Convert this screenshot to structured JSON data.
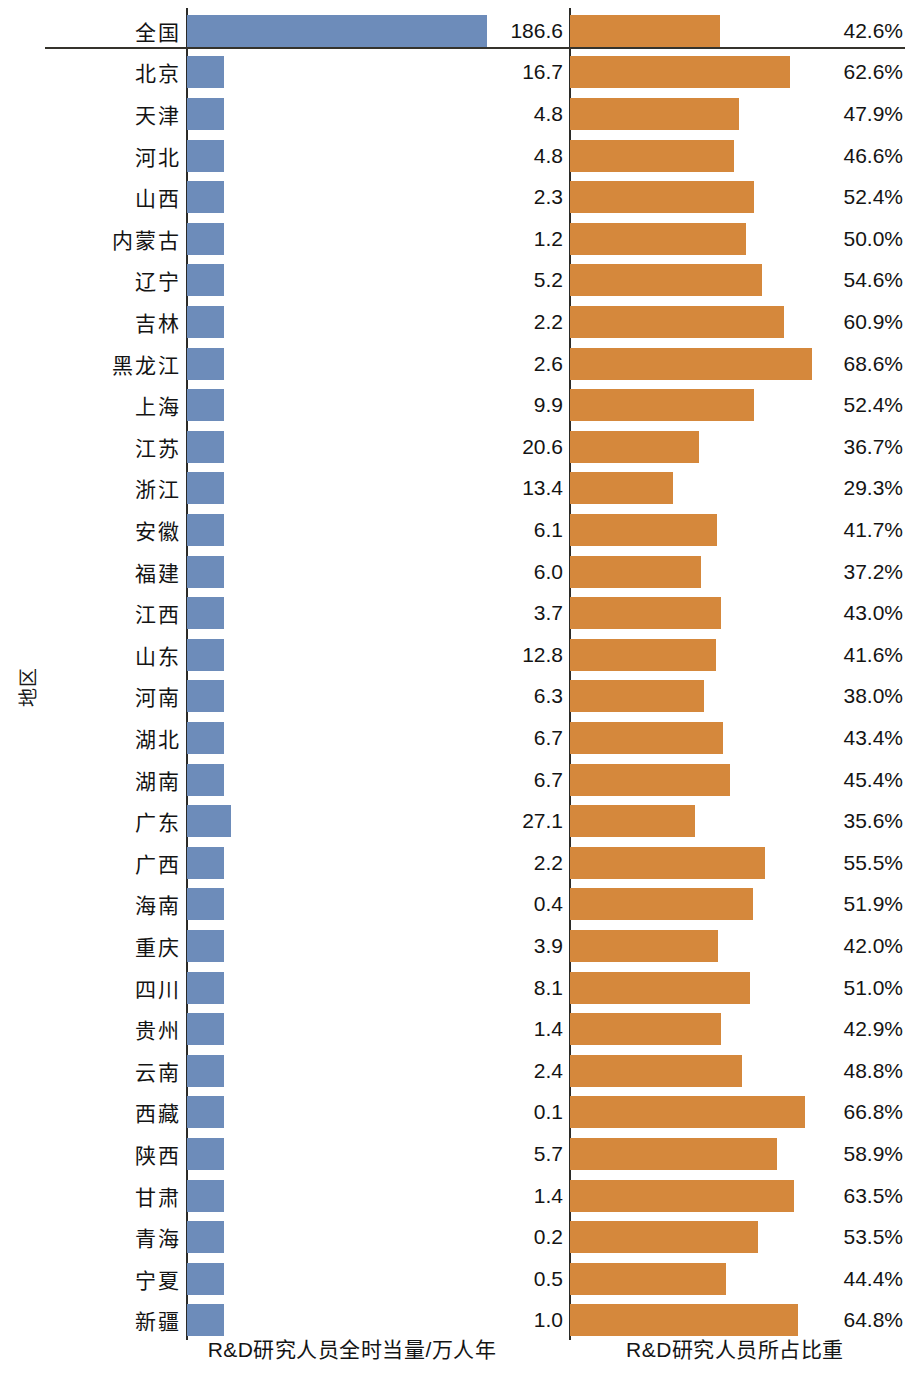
{
  "axis": {
    "y_title": "地区",
    "left_caption": "R&D研究人员全时当量/万人年",
    "right_caption": "R&D研究人员所占比重"
  },
  "colors": {
    "blue": "#6d8cba",
    "orange": "#d5883c",
    "axis": "#2b2b28",
    "text": "#141414"
  },
  "chart_data": {
    "type": "bar",
    "title": "",
    "subtitle": "",
    "orientation": "horizontal",
    "ylabel": "地区",
    "panels": [
      {
        "name": "left",
        "label": "R&D研究人员全时当量/万人年",
        "unit": "万人年",
        "axis_min": 0,
        "axis_max": 190
      },
      {
        "name": "right",
        "label": "R&D研究人员所占比重",
        "unit": "%",
        "axis_min": 0,
        "axis_max": 70
      }
    ],
    "grid": false,
    "legend": "none",
    "categories": [
      "全国",
      "北京",
      "天津",
      "河北",
      "山西",
      "内蒙古",
      "辽宁",
      "吉林",
      "黑龙江",
      "上海",
      "江苏",
      "浙江",
      "安徽",
      "福建",
      "江西",
      "山东",
      "河南",
      "湖北",
      "湖南",
      "广东",
      "广西",
      "海南",
      "重庆",
      "四川",
      "贵州",
      "云南",
      "西藏",
      "陕西",
      "甘肃",
      "青海",
      "宁夏",
      "新疆"
    ],
    "series": [
      {
        "name": "R&D研究人员全时当量/万人年",
        "color": "#6d8cba",
        "values": [
          186.6,
          16.7,
          4.8,
          4.8,
          2.3,
          1.2,
          5.2,
          2.2,
          2.6,
          9.9,
          20.6,
          13.4,
          6.1,
          6.0,
          3.7,
          12.8,
          6.3,
          6.7,
          6.7,
          27.1,
          2.2,
          0.4,
          3.9,
          8.1,
          1.4,
          2.4,
          0.1,
          5.7,
          1.4,
          0.2,
          0.5,
          1.0
        ]
      },
      {
        "name": "R&D研究人员所占比重",
        "color": "#d5883c",
        "values": [
          42.6,
          62.6,
          47.9,
          46.6,
          52.4,
          50.0,
          54.6,
          60.9,
          68.6,
          52.4,
          36.7,
          29.3,
          41.7,
          37.2,
          43.0,
          41.6,
          38.0,
          43.4,
          45.4,
          35.6,
          55.5,
          51.9,
          42.0,
          51.0,
          42.9,
          48.8,
          66.8,
          58.9,
          63.5,
          53.5,
          44.4,
          64.8
        ]
      }
    ]
  },
  "rows": [
    {
      "label": "全国",
      "value": "186.6",
      "v": 186.6,
      "pct": "42.6%",
      "p": 42.6,
      "is_total": true
    },
    {
      "label": "北京",
      "value": "16.7",
      "v": 16.7,
      "pct": "62.6%",
      "p": 62.6,
      "is_total": false
    },
    {
      "label": "天津",
      "value": "4.8",
      "v": 4.8,
      "pct": "47.9%",
      "p": 47.9,
      "is_total": false
    },
    {
      "label": "河北",
      "value": "4.8",
      "v": 4.8,
      "pct": "46.6%",
      "p": 46.6,
      "is_total": false
    },
    {
      "label": "山西",
      "value": "2.3",
      "v": 2.3,
      "pct": "52.4%",
      "p": 52.4,
      "is_total": false
    },
    {
      "label": "内蒙古",
      "value": "1.2",
      "v": 1.2,
      "pct": "50.0%",
      "p": 50.0,
      "is_total": false
    },
    {
      "label": "辽宁",
      "value": "5.2",
      "v": 5.2,
      "pct": "54.6%",
      "p": 54.6,
      "is_total": false
    },
    {
      "label": "吉林",
      "value": "2.2",
      "v": 2.2,
      "pct": "60.9%",
      "p": 60.9,
      "is_total": false
    },
    {
      "label": "黑龙江",
      "value": "2.6",
      "v": 2.6,
      "pct": "68.6%",
      "p": 68.6,
      "is_total": false
    },
    {
      "label": "上海",
      "value": "9.9",
      "v": 9.9,
      "pct": "52.4%",
      "p": 52.4,
      "is_total": false
    },
    {
      "label": "江苏",
      "value": "20.6",
      "v": 20.6,
      "pct": "36.7%",
      "p": 36.7,
      "is_total": false
    },
    {
      "label": "浙江",
      "value": "13.4",
      "v": 13.4,
      "pct": "29.3%",
      "p": 29.3,
      "is_total": false
    },
    {
      "label": "安徽",
      "value": "6.1",
      "v": 6.1,
      "pct": "41.7%",
      "p": 41.7,
      "is_total": false
    },
    {
      "label": "福建",
      "value": "6.0",
      "v": 6.0,
      "pct": "37.2%",
      "p": 37.2,
      "is_total": false
    },
    {
      "label": "江西",
      "value": "3.7",
      "v": 3.7,
      "pct": "43.0%",
      "p": 43.0,
      "is_total": false
    },
    {
      "label": "山东",
      "value": "12.8",
      "v": 12.8,
      "pct": "41.6%",
      "p": 41.6,
      "is_total": false
    },
    {
      "label": "河南",
      "value": "6.3",
      "v": 6.3,
      "pct": "38.0%",
      "p": 38.0,
      "is_total": false
    },
    {
      "label": "湖北",
      "value": "6.7",
      "v": 6.7,
      "pct": "43.4%",
      "p": 43.4,
      "is_total": false
    },
    {
      "label": "湖南",
      "value": "6.7",
      "v": 6.7,
      "pct": "45.4%",
      "p": 45.4,
      "is_total": false
    },
    {
      "label": "广东",
      "value": "27.1",
      "v": 27.1,
      "pct": "35.6%",
      "p": 35.6,
      "is_total": false
    },
    {
      "label": "广西",
      "value": "2.2",
      "v": 2.2,
      "pct": "55.5%",
      "p": 55.5,
      "is_total": false
    },
    {
      "label": "海南",
      "value": "0.4",
      "v": 0.4,
      "pct": "51.9%",
      "p": 51.9,
      "is_total": false
    },
    {
      "label": "重庆",
      "value": "3.9",
      "v": 3.9,
      "pct": "42.0%",
      "p": 42.0,
      "is_total": false
    },
    {
      "label": "四川",
      "value": "8.1",
      "v": 8.1,
      "pct": "51.0%",
      "p": 51.0,
      "is_total": false
    },
    {
      "label": "贵州",
      "value": "1.4",
      "v": 1.4,
      "pct": "42.9%",
      "p": 42.9,
      "is_total": false
    },
    {
      "label": "云南",
      "value": "2.4",
      "v": 2.4,
      "pct": "48.8%",
      "p": 48.8,
      "is_total": false
    },
    {
      "label": "西藏",
      "value": "0.1",
      "v": 0.1,
      "pct": "66.8%",
      "p": 66.8,
      "is_total": false
    },
    {
      "label": "陕西",
      "value": "5.7",
      "v": 5.7,
      "pct": "58.9%",
      "p": 58.9,
      "is_total": false
    },
    {
      "label": "甘肃",
      "value": "1.4",
      "v": 1.4,
      "pct": "63.5%",
      "p": 63.5,
      "is_total": false
    },
    {
      "label": "青海",
      "value": "0.2",
      "v": 0.2,
      "pct": "53.5%",
      "p": 53.5,
      "is_total": false
    },
    {
      "label": "宁夏",
      "value": "0.5",
      "v": 0.5,
      "pct": "44.4%",
      "p": 44.4,
      "is_total": false
    },
    {
      "label": "新疆",
      "value": "1.0",
      "v": 1.0,
      "pct": "64.8%",
      "p": 64.8,
      "is_total": false
    }
  ]
}
